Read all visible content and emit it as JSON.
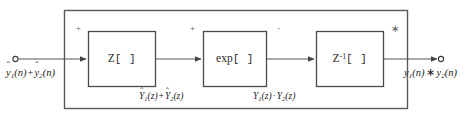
{
  "diagram": {
    "colors": {
      "stroke": "#555555",
      "box_stroke": "#4a4a4a",
      "text": "#1c1c1c",
      "background": "#ffffff"
    },
    "input": {
      "terminal": "open-circle",
      "label_plain": "ŷ1(n) + ŷ2(n)",
      "var": "y",
      "index1": "1",
      "index2": "2",
      "arg": "(n)",
      "operator": "+",
      "hat": true
    },
    "output": {
      "terminal": "open-circle",
      "label_plain": "y1(n) ∗ y2(n)",
      "var": "y",
      "index1": "1",
      "index2": "2",
      "arg": "(n)",
      "operator": "∗",
      "hat": false
    },
    "blocks": [
      {
        "id": "z-transform",
        "label_plain": "Z[ ]",
        "symbol": "Z",
        "brackets": "[ ]",
        "superscript": "",
        "op_mark": "+",
        "op_mark_name": "plus-sign"
      },
      {
        "id": "exponential",
        "label_plain": "exp[ ]",
        "symbol": "exp",
        "brackets": "[ ]",
        "superscript": "",
        "op_mark": "+",
        "op_mark_name": "plus-sign"
      },
      {
        "id": "inverse-z-transform",
        "label_plain": "Z⁻¹[ ]",
        "symbol": "Z",
        "brackets": "[ ]",
        "superscript": "-1",
        "op_mark": "·",
        "op_mark_name": "dot-operator"
      }
    ],
    "output_op_mark": {
      "mark": "∗",
      "name": "asterisk-convolution-sign"
    },
    "intermediate_labels": [
      {
        "id": "after-z-transform",
        "label_plain": "Ŷ1(z) + Ŷ2(z)",
        "var": "Y",
        "index1": "1",
        "index2": "2",
        "arg": "(z)",
        "operator": "+",
        "hat": true
      },
      {
        "id": "after-exponential",
        "label_plain": "Y1(z) · Y2(z)",
        "var": "Y",
        "index1": "1",
        "index2": "2",
        "arg": "(z)",
        "operator": "·",
        "hat": false
      }
    ]
  }
}
